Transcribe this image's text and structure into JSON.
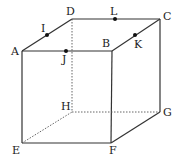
{
  "diagram": {
    "title": "",
    "type": "cube",
    "vertices": {
      "A": {
        "x": 22,
        "y": 51,
        "label": "A",
        "lx": 11,
        "ly": 55
      },
      "B": {
        "x": 112,
        "y": 51,
        "label": "B",
        "lx": 102,
        "ly": 47
      },
      "C": {
        "x": 160,
        "y": 19,
        "label": "C",
        "lx": 163,
        "ly": 20
      },
      "D": {
        "x": 72,
        "y": 19,
        "label": "D",
        "lx": 66,
        "ly": 15
      },
      "E": {
        "x": 22,
        "y": 143,
        "label": "E",
        "lx": 12,
        "ly": 154
      },
      "F": {
        "x": 111,
        "y": 143,
        "label": "F",
        "lx": 109,
        "ly": 154
      },
      "G": {
        "x": 160,
        "y": 112,
        "label": "G",
        "lx": 163,
        "ly": 116
      },
      "H": {
        "x": 72,
        "y": 112,
        "label": "H",
        "lx": 61,
        "ly": 110
      }
    },
    "points": {
      "I": {
        "x": 47,
        "y": 35,
        "label": "I",
        "lx": 41,
        "ly": 32
      },
      "J": {
        "x": 66,
        "y": 51,
        "label": "J",
        "lx": 62,
        "ly": 63
      },
      "K": {
        "x": 135,
        "y": 35,
        "label": "K",
        "lx": 134,
        "ly": 48
      },
      "L": {
        "x": 115,
        "y": 19,
        "label": "L",
        "lx": 110,
        "ly": 15
      }
    },
    "edges_visible": [
      "AB",
      "BC",
      "CD",
      "DA",
      "AE",
      "BF",
      "CG",
      "EF",
      "FG"
    ],
    "edges_hidden": [
      "DH",
      "EH",
      "HG"
    ],
    "colors": {
      "line": "#333333",
      "point": "#111111",
      "text": "#222222"
    }
  }
}
